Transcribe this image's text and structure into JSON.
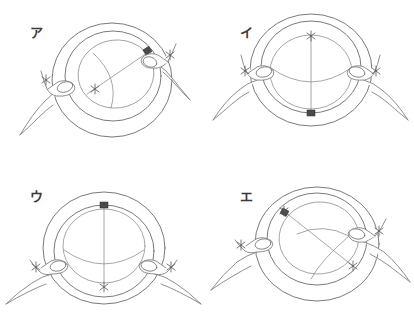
{
  "figure": {
    "width": 414,
    "height": 328,
    "background_color": "#ffffff",
    "line_color": "#6b6b6b",
    "marker_color": "#4a4a4a",
    "star_color": "#555555",
    "layout": "2x2 grid",
    "panel_count": 4
  },
  "panels": [
    {
      "label": "ア",
      "label_name": "panel-label-a",
      "position": "top-left",
      "marker_position": "upper-right rim",
      "star_positions": [
        "left rim near left hand",
        "inside membrane left of center",
        "right hand fingertip"
      ],
      "hands": [
        "left hand pinching left rim",
        "right hand pinching upper-right rim"
      ],
      "membrane": "tilted ellipse with diagonal chord and curved meridian"
    },
    {
      "label": "イ",
      "label_name": "panel-label-i",
      "position": "top-right",
      "marker_position": "bottom rim",
      "star_positions": [
        "top of vertical line",
        "left hand fingertip",
        "right hand fingertip"
      ],
      "hands": [
        "left hand pinching left rim",
        "right hand pinching right rim"
      ],
      "membrane": "ellipse with vertical line and curved latitude arc"
    },
    {
      "label": "ウ",
      "label_name": "panel-label-u",
      "position": "bottom-left",
      "marker_position": "top rim",
      "star_positions": [
        "bottom of vertical line",
        "left hand fingertip",
        "right hand fingertip"
      ],
      "hands": [
        "left hand pinching lower-left rim",
        "right hand pinching lower-right rim"
      ],
      "membrane": "ellipse with vertical line and curved latitude arc"
    },
    {
      "label": "エ",
      "label_name": "panel-label-e",
      "position": "bottom-right",
      "marker_position": "upper-left rim",
      "star_positions": [
        "upper-left rim at marker",
        "lower-right end of diagonal",
        "left hand fingertip",
        "right hand fingertip"
      ],
      "hands": [
        "left hand pinching left rim",
        "right hand pinching right rim"
      ],
      "membrane": "tilted ellipse with diagonal chord and curved meridian"
    }
  ]
}
